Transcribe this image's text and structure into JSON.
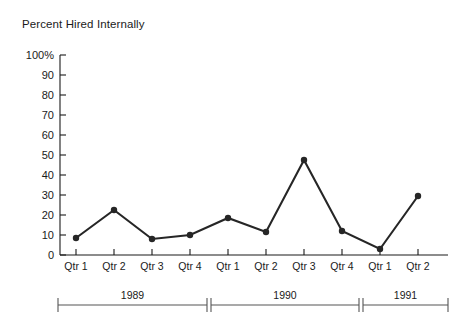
{
  "chart_data": {
    "type": "line",
    "title": "Percent Hired Internally",
    "xlabel": "",
    "ylabel": "",
    "ylim": [
      0,
      100
    ],
    "grid": false,
    "legend": null,
    "categories": [
      "Qtr 1",
      "Qtr 2",
      "Qtr 3",
      "Qtr 4",
      "Qtr 1",
      "Qtr 2",
      "Qtr 3",
      "Qtr 4",
      "Qtr 1",
      "Qtr 2"
    ],
    "values": [
      8.5,
      22.5,
      8,
      10,
      18.5,
      11.5,
      47.5,
      12,
      3,
      29.5
    ],
    "ytick_labels": [
      "100%",
      "90",
      "80",
      "70",
      "60",
      "50",
      "40",
      "30",
      "20",
      "10",
      "0"
    ],
    "ytick_values": [
      100,
      90,
      80,
      70,
      60,
      50,
      40,
      30,
      20,
      10,
      0
    ],
    "group_axis": {
      "labels": [
        "1989",
        "1990",
        "1991"
      ],
      "spans": [
        [
          0,
          3
        ],
        [
          4,
          7
        ],
        [
          8,
          9
        ]
      ]
    },
    "series_color": "#262626",
    "axis_color": "#1a1a1a",
    "bracket_color": "#555555"
  }
}
